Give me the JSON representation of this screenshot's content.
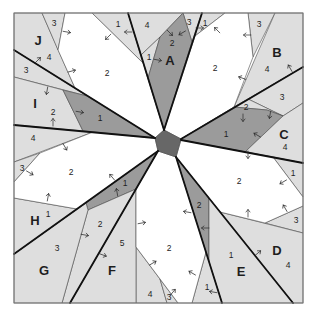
{
  "diagram": {
    "kind": "foundation paper-piecing quilt block pattern",
    "sections_count": 10
  },
  "colors": {
    "background": "#ffffff",
    "white": "#ffffff",
    "light": "#dedede",
    "dark": "#9b9b9b",
    "center": "#676767",
    "frame": "#7a7a7a",
    "line": "#111111"
  },
  "sections": [
    {
      "id": "A",
      "label": "A",
      "pieces": [
        "1",
        "2",
        "3",
        "4"
      ]
    },
    {
      "id": "B",
      "label": "B",
      "pieces": [
        "1",
        "2",
        "3",
        "4"
      ]
    },
    {
      "id": "C",
      "label": "C",
      "pieces": [
        "1",
        "2",
        "3",
        "4"
      ]
    },
    {
      "id": "D",
      "label": "D",
      "pieces": [
        "1",
        "2",
        "3",
        "4"
      ]
    },
    {
      "id": "E",
      "label": "E",
      "pieces": [
        "1",
        "2"
      ]
    },
    {
      "id": "F",
      "label": "F",
      "pieces": [
        "1",
        "2",
        "3",
        "4",
        "5"
      ]
    },
    {
      "id": "G",
      "label": "G",
      "pieces": [
        "1",
        "2",
        "3"
      ]
    },
    {
      "id": "H",
      "label": "H",
      "pieces": [
        "1",
        "2",
        "3",
        "4"
      ]
    },
    {
      "id": "I",
      "label": "I",
      "pieces": [
        "1",
        "2",
        "3"
      ]
    },
    {
      "id": "J",
      "label": "J",
      "pieces": [
        "1",
        "2",
        "3",
        "4"
      ]
    }
  ],
  "arrows": [
    {
      "x": 67,
      "y": 32,
      "angle": 10
    },
    {
      "x": 108,
      "y": 37,
      "angle": 135
    },
    {
      "x": 128,
      "y": 32,
      "angle": 180
    },
    {
      "x": 72,
      "y": 71,
      "angle": -15
    },
    {
      "x": 38,
      "y": 60,
      "angle": -45
    },
    {
      "x": 47,
      "y": 91,
      "angle": 100
    },
    {
      "x": 80,
      "y": 112,
      "angle": 10
    },
    {
      "x": 53,
      "y": 122,
      "angle": -90
    },
    {
      "x": 65,
      "y": 147,
      "angle": 60
    },
    {
      "x": 170,
      "y": 33,
      "angle": 45
    },
    {
      "x": 182,
      "y": 33,
      "angle": 150
    },
    {
      "x": 158,
      "y": 60,
      "angle": 10
    },
    {
      "x": 200,
      "y": 28,
      "angle": 0
    },
    {
      "x": 217,
      "y": 30,
      "angle": -135
    },
    {
      "x": 247,
      "y": 35,
      "angle": 180
    },
    {
      "x": 242,
      "y": 78,
      "angle": 200
    },
    {
      "x": 290,
      "y": 68,
      "angle": -120
    },
    {
      "x": 243,
      "y": 118,
      "angle": 90
    },
    {
      "x": 270,
      "y": 115,
      "angle": 100
    },
    {
      "x": 257,
      "y": 135,
      "angle": -150
    },
    {
      "x": 248,
      "y": 155,
      "angle": 90
    },
    {
      "x": 30,
      "y": 173,
      "angle": 30
    },
    {
      "x": 112,
      "y": 177,
      "angle": -130
    },
    {
      "x": 117,
      "y": 192,
      "angle": -100
    },
    {
      "x": 48,
      "y": 197,
      "angle": -80
    },
    {
      "x": 85,
      "y": 235,
      "angle": 10
    },
    {
      "x": 103,
      "y": 255,
      "angle": 20
    },
    {
      "x": 142,
      "y": 223,
      "angle": -10
    },
    {
      "x": 153,
      "y": 263,
      "angle": -30
    },
    {
      "x": 283,
      "y": 182,
      "angle": 150
    },
    {
      "x": 248,
      "y": 213,
      "angle": -90
    },
    {
      "x": 285,
      "y": 208,
      "angle": -120
    },
    {
      "x": 187,
      "y": 212,
      "angle": 190
    },
    {
      "x": 205,
      "y": 228,
      "angle": 180
    },
    {
      "x": 258,
      "y": 253,
      "angle": -40
    },
    {
      "x": 192,
      "y": 273,
      "angle": -150
    },
    {
      "x": 213,
      "y": 292,
      "angle": 190
    },
    {
      "x": 173,
      "y": 292,
      "angle": -50
    }
  ]
}
